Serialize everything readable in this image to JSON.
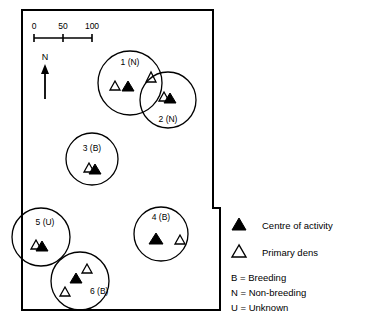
{
  "figure": {
    "type": "map",
    "background_color": "#ffffff",
    "line_color": "#000000"
  },
  "scale_bar": {
    "ticks": [
      "0",
      "50",
      "100"
    ],
    "tick_values": [
      0,
      50,
      100
    ]
  },
  "north_arrow": {
    "label": "N"
  },
  "territories": [
    {
      "id": "1",
      "label": "1 (N)",
      "status_code": "N",
      "cx": 130,
      "cy": 83,
      "r": 32,
      "label_x": 130,
      "label_y": 65,
      "markers": [
        {
          "kind": "primary-den",
          "x": 115,
          "y": 86
        },
        {
          "kind": "centre-of-activity",
          "x": 128,
          "y": 88
        },
        {
          "kind": "primary-den",
          "x": 151,
          "y": 78
        }
      ]
    },
    {
      "id": "2",
      "label": "2 (N)",
      "status_code": "N",
      "cx": 168,
      "cy": 100,
      "r": 28,
      "label_x": 168,
      "label_y": 122,
      "markers": [
        {
          "kind": "primary-den",
          "x": 164,
          "y": 97
        },
        {
          "kind": "centre-of-activity",
          "x": 169,
          "y": 99
        }
      ]
    },
    {
      "id": "3",
      "label": "3 (B)",
      "status_code": "B",
      "cx": 92,
      "cy": 159,
      "r": 26,
      "label_x": 92,
      "label_y": 151,
      "markers": [
        {
          "kind": "primary-den",
          "x": 89,
          "y": 168
        },
        {
          "kind": "centre-of-activity",
          "x": 94,
          "y": 170
        }
      ]
    },
    {
      "id": "4",
      "label": "4 (B)",
      "status_code": "B",
      "cx": 161,
      "cy": 234,
      "r": 27,
      "label_x": 161,
      "label_y": 220,
      "markers": [
        {
          "kind": "centre-of-activity",
          "x": 156,
          "y": 240
        },
        {
          "kind": "primary-den",
          "x": 180,
          "y": 240
        }
      ]
    },
    {
      "id": "5",
      "label": "5 (U)",
      "status_code": "U",
      "cx": 41,
      "cy": 237,
      "r": 29,
      "label_x": 45,
      "label_y": 225,
      "markers": [
        {
          "kind": "primary-den",
          "x": 36,
          "y": 245
        },
        {
          "kind": "centre-of-activity",
          "x": 41,
          "y": 247
        }
      ]
    },
    {
      "id": "6",
      "label": "6 (B)",
      "status_code": "B",
      "cx": 80,
      "cy": 281,
      "r": 29,
      "label_x": 90,
      "label_y": 294,
      "markers": [
        {
          "kind": "primary-den",
          "x": 87,
          "y": 270
        },
        {
          "kind": "centre-of-activity",
          "x": 76,
          "y": 280
        },
        {
          "kind": "primary-den",
          "x": 65,
          "y": 294
        }
      ]
    }
  ],
  "legend": {
    "entries": [
      {
        "symbol": "filled-triangle",
        "label": "Centre of activity"
      },
      {
        "symbol": "open-triangle",
        "label": "Primary dens"
      }
    ],
    "abbreviations": [
      "B = Breeding",
      "N = Non-breeding",
      "U = Unknown"
    ]
  }
}
